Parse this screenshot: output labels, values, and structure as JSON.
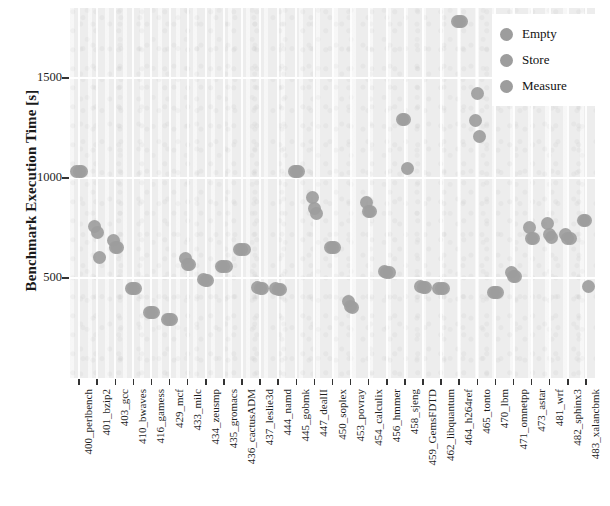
{
  "chart_data": {
    "type": "scatter",
    "title": "",
    "xlabel": "",
    "ylabel": "Benchmark Execution Time [s]",
    "ylim": [
      0,
      1850
    ],
    "yticks": [
      500,
      1000,
      1500
    ],
    "ytick_labels": [
      "500",
      "1000",
      "1500"
    ],
    "grid": true,
    "legend_position": "top-right",
    "categories": [
      "400_perlbench",
      "401_bzip2",
      "403_gcc",
      "410_bwaves",
      "416_gamess",
      "429_mcf",
      "433_milc",
      "434_zeusmp",
      "435_gromacs",
      "436_cactusADM",
      "437_leslie3d",
      "444_namd",
      "445_gobmk",
      "447_dealII",
      "450_soplex",
      "453_povray",
      "454_calculix",
      "456_hmmer",
      "458_sjeng",
      "459_GemsFDTD",
      "462_libquantum",
      "464_h264ref",
      "465_tonto",
      "470_lbm",
      "471_omnetpp",
      "473_astar",
      "481_wrf",
      "482_sphinx3",
      "483_xalancbmk"
    ],
    "series": [
      {
        "name": "Empty",
        "color": "#9d9d9d",
        "values": [
          1035,
          760,
          690,
          450,
          330,
          295,
          600,
          495,
          560,
          645,
          455,
          450,
          1035,
          905,
          655,
          385,
          880,
          535,
          1295,
          460,
          450,
          1785,
          1290,
          430,
          530,
          755,
          775,
          720,
          790
        ]
      },
      {
        "name": "Store",
        "color": "#9d9d9d",
        "values": [
          1035,
          730,
          655,
          450,
          330,
          295,
          570,
          490,
          560,
          645,
          450,
          445,
          1035,
          850,
          655,
          360,
          835,
          530,
          1295,
          455,
          450,
          1785,
          1425,
          430,
          510,
          700,
          720,
          700,
          790
        ]
      },
      {
        "name": "Measure",
        "color": "#9d9d9d",
        "values": [
          1035,
          605,
          655,
          450,
          330,
          295,
          570,
          490,
          560,
          645,
          450,
          445,
          1035,
          825,
          655,
          355,
          835,
          530,
          1050,
          455,
          450,
          1785,
          1210,
          430,
          510,
          700,
          705,
          700,
          460
        ]
      }
    ]
  },
  "legend": {
    "items": [
      {
        "label": "Empty",
        "color": "#9d9d9d"
      },
      {
        "label": "Store",
        "color": "#9d9d9d"
      },
      {
        "label": "Measure",
        "color": "#9d9d9d"
      }
    ]
  }
}
